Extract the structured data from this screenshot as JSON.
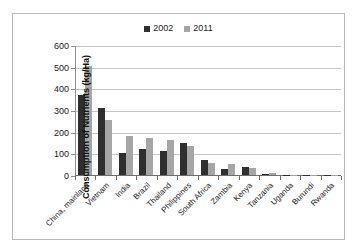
{
  "chart_data": {
    "type": "bar",
    "title": "",
    "xlabel": "",
    "ylabel": "Consumption of Nutrients (kg/Ha)",
    "ylim": [
      0,
      600
    ],
    "yticks": [
      0,
      100,
      200,
      300,
      400,
      500,
      600
    ],
    "grid": true,
    "legend_position": "top-center",
    "categories": [
      "China, mainland",
      "Vietnam",
      "India",
      "Brazil",
      "Thailand",
      "Philippines",
      "South Africa",
      "Zambia",
      "Kenya",
      "Tanzania",
      "Uganda",
      "Burundi",
      "Rwanda"
    ],
    "series": [
      {
        "name": "2002",
        "color": "#2f2f2f",
        "values": [
          370,
          307,
          102,
          122,
          112,
          148,
          68,
          30,
          35,
          4,
          1,
          1,
          1
        ]
      },
      {
        "name": "2011",
        "color": "#a6a6a6",
        "values": [
          505,
          253,
          178,
          170,
          163,
          132,
          57,
          53,
          34,
          11,
          2,
          1,
          1
        ]
      }
    ]
  },
  "colors": {
    "series_2002": "#2f2f2f",
    "series_2011": "#a6a6a6",
    "gridline": "#c6c6c6",
    "axis": "#6e6e6e",
    "frame_border": "#b9b9b9",
    "text": "#1a1a1a",
    "background": "#ffffff"
  }
}
